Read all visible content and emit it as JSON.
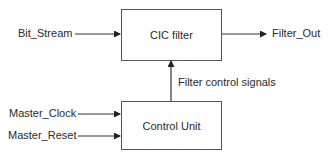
{
  "diagram": {
    "type": "block-diagram",
    "blocks": {
      "cic_filter": {
        "label": "CIC filter"
      },
      "control_unit": {
        "label": "Control Unit"
      }
    },
    "signals": {
      "bit_stream": "Bit_Stream",
      "filter_out": "Filter_Out",
      "filter_control": "Filter control signals",
      "master_clock": "Master_Clock",
      "master_reset": "Master_Reset"
    },
    "edges": [
      {
        "from": "Bit_Stream",
        "to": "CIC filter"
      },
      {
        "from": "CIC filter",
        "to": "Filter_Out"
      },
      {
        "from": "Control Unit",
        "to": "CIC filter",
        "label": "Filter control signals"
      },
      {
        "from": "Master_Clock",
        "to": "Control Unit"
      },
      {
        "from": "Master_Reset",
        "to": "Control Unit"
      }
    ],
    "colors": {
      "line": "#333333",
      "text": "#2a2a2a",
      "background": "#ffffff"
    }
  }
}
